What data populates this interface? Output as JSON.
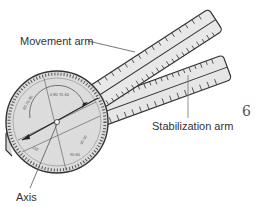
{
  "diagram": {
    "labels": {
      "movement_arm": "Movement arm",
      "stabilization_arm": "Stabilization arm",
      "axis": "Axis"
    },
    "logo_glyph": "6",
    "colors": {
      "outline": "#333333",
      "fill": "#e4e4e4",
      "dial_fill": "#dcdcdc",
      "text": "#333333",
      "leader_line": "#555555"
    }
  }
}
